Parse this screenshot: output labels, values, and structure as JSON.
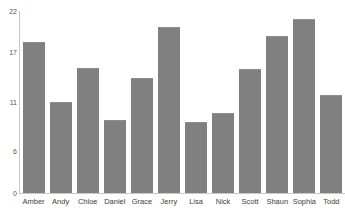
{
  "chart_data": {
    "type": "bar",
    "title": "",
    "xlabel": "",
    "ylabel": "",
    "categories": [
      "Amber",
      "Andy",
      "Chloe",
      "Daniel",
      "Grace",
      "Jerry",
      "Lisa",
      "Nick",
      "Scott",
      "Shaun",
      "Sophia",
      "Todd"
    ],
    "values": [
      18.3,
      11.0,
      15.1,
      8.8,
      13.9,
      20.1,
      8.6,
      9.7,
      15.0,
      19.0,
      21.0,
      11.8
    ],
    "ylim": [
      0,
      22
    ],
    "yticks": [
      0,
      6,
      11,
      17,
      22
    ],
    "ytick_labels": [
      "0",
      "6",
      "11",
      "17",
      "22"
    ],
    "grid": false,
    "legend": null,
    "bar_color": "#808080",
    "axis_color": "#c8c8c8",
    "background": "#ffffff"
  },
  "axis": {
    "y_labels": [
      "22",
      "17",
      "11",
      "6",
      "0"
    ]
  }
}
